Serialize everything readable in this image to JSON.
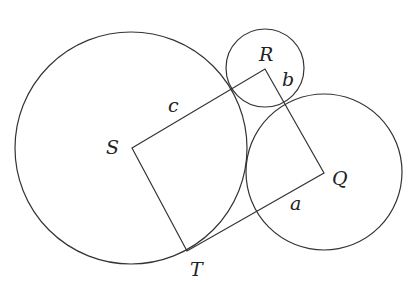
{
  "diagram": {
    "circles": [
      {
        "name": "circle-s",
        "cx": 131,
        "cy": 148,
        "r": 116
      },
      {
        "name": "circle-r",
        "cx": 265,
        "cy": 68,
        "r": 39
      },
      {
        "name": "circle-q",
        "cx": 324,
        "cy": 172,
        "r": 78
      }
    ],
    "rectangle": {
      "S": [
        132,
        148
      ],
      "R": [
        265,
        69
      ],
      "Q": [
        324,
        173
      ],
      "T": [
        187,
        251
      ]
    },
    "labels": {
      "S": "S",
      "R": "R",
      "Q": "Q",
      "T": "T",
      "a": "a",
      "b": "b",
      "c": "c"
    }
  }
}
